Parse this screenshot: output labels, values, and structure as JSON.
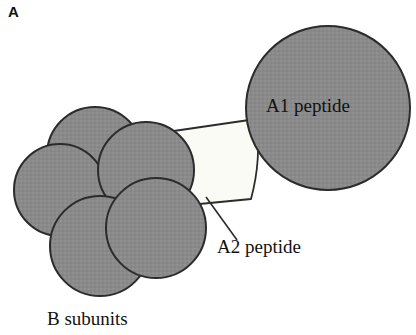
{
  "figure": {
    "panel_label": "A",
    "background_color": "#ffffff"
  },
  "labels": {
    "a1_peptide": "A1 peptide",
    "a2_peptide": "A2 peptide",
    "b_subunits": "B subunits"
  },
  "colors": {
    "subunit_fill": "#8a8a8a",
    "subunit_stroke": "#2b2b2b",
    "a2_fill": "#fbfbf5",
    "a2_stroke": "#2b2b2b",
    "text": "#111111",
    "leader_line": "#2b2b2b"
  },
  "diagram_data": {
    "type": "schematic",
    "subject": "AB5 toxin holotoxin structure",
    "shapes": [
      {
        "name": "b-subunit-1",
        "kind": "circle",
        "cx": 95,
        "cy": 155,
        "r": 48
      },
      {
        "name": "b-subunit-2",
        "kind": "circle",
        "cx": 60,
        "cy": 188,
        "r": 46
      },
      {
        "name": "b-subunit-3",
        "kind": "circle",
        "cx": 145,
        "cy": 170,
        "r": 48
      },
      {
        "name": "b-subunit-4",
        "kind": "circle",
        "cx": 102,
        "cy": 245,
        "r": 50
      },
      {
        "name": "b-subunit-5",
        "kind": "circle",
        "cx": 156,
        "cy": 228,
        "r": 50
      },
      {
        "name": "a1-peptide",
        "kind": "circle",
        "cx": 328,
        "cy": 108,
        "r": 82
      },
      {
        "name": "a2-peptide",
        "kind": "quadrilateral",
        "points": "163,134 253,122 249,196 160,206"
      }
    ],
    "leader_line": {
      "x1": 206,
      "x2": 236,
      "y1": 197,
      "y2": 239
    }
  }
}
